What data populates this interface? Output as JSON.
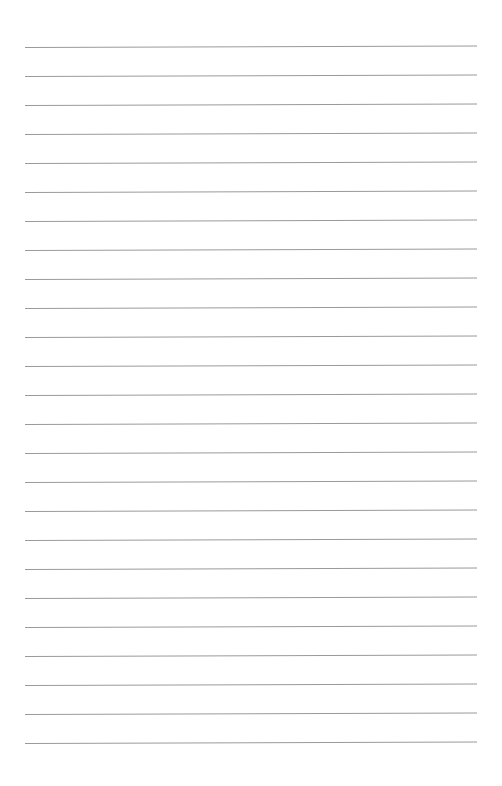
{
  "document": {
    "type": "ruled-paper",
    "title": "Blank ruled notebook page",
    "body_text": "",
    "page_background_color": "#ffffff",
    "rule_color": "#9a9a9a",
    "rule_thickness_px": 1,
    "geometry": {
      "page_width_px": 502,
      "page_height_px": 786,
      "rule_left_x_px": 25,
      "rule_right_x_px": 477,
      "rule_width_px": 452,
      "first_rule_y_px": 47,
      "last_rule_y_px": 743,
      "rule_spacing_px": 29,
      "rule_count": 25,
      "top_margin_px": 47,
      "bottom_margin_px": 43,
      "left_margin_px": 25,
      "right_margin_px": 25,
      "rule_slant_deg": -0.18
    },
    "rules": [
      {
        "index": 1,
        "y": 47,
        "left": 25,
        "right": 477
      },
      {
        "index": 2,
        "y": 76,
        "left": 25,
        "right": 477
      },
      {
        "index": 3,
        "y": 105,
        "left": 25,
        "right": 477
      },
      {
        "index": 4,
        "y": 134,
        "left": 25,
        "right": 477
      },
      {
        "index": 5,
        "y": 163,
        "left": 25,
        "right": 477
      },
      {
        "index": 6,
        "y": 192,
        "left": 25,
        "right": 477
      },
      {
        "index": 7,
        "y": 221,
        "left": 25,
        "right": 477
      },
      {
        "index": 8,
        "y": 250,
        "left": 25,
        "right": 477
      },
      {
        "index": 9,
        "y": 279,
        "left": 25,
        "right": 477
      },
      {
        "index": 10,
        "y": 308,
        "left": 25,
        "right": 477
      },
      {
        "index": 11,
        "y": 337,
        "left": 25,
        "right": 477
      },
      {
        "index": 12,
        "y": 366,
        "left": 25,
        "right": 477
      },
      {
        "index": 13,
        "y": 395,
        "left": 25,
        "right": 477
      },
      {
        "index": 14,
        "y": 424,
        "left": 25,
        "right": 477
      },
      {
        "index": 15,
        "y": 453,
        "left": 25,
        "right": 477
      },
      {
        "index": 16,
        "y": 482,
        "left": 25,
        "right": 477
      },
      {
        "index": 17,
        "y": 511,
        "left": 25,
        "right": 477
      },
      {
        "index": 18,
        "y": 540,
        "left": 25,
        "right": 477
      },
      {
        "index": 19,
        "y": 569,
        "left": 25,
        "right": 477
      },
      {
        "index": 20,
        "y": 598,
        "left": 25,
        "right": 477
      },
      {
        "index": 21,
        "y": 627,
        "left": 25,
        "right": 477
      },
      {
        "index": 22,
        "y": 656,
        "left": 25,
        "right": 477
      },
      {
        "index": 23,
        "y": 685,
        "left": 25,
        "right": 477
      },
      {
        "index": 24,
        "y": 714,
        "left": 25,
        "right": 477
      },
      {
        "index": 25,
        "y": 743,
        "left": 25,
        "right": 477
      }
    ]
  }
}
